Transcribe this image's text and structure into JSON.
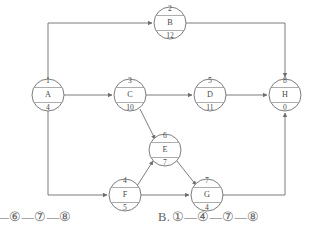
{
  "diagram": {
    "type": "activity-on-node network diagram",
    "nodes": [
      {
        "id": "n2",
        "number": "2",
        "activity": "B",
        "duration": "12",
        "cx": 170,
        "cy": 23,
        "r": 16
      },
      {
        "id": "n1",
        "number": "1",
        "activity": "A",
        "duration": "4",
        "cx": 48,
        "cy": 95,
        "r": 16
      },
      {
        "id": "n3",
        "number": "3",
        "activity": "C",
        "duration": "10",
        "cx": 130,
        "cy": 95,
        "r": 16
      },
      {
        "id": "n5",
        "number": "5",
        "activity": "D",
        "duration": "11",
        "cx": 210,
        "cy": 95,
        "r": 16
      },
      {
        "id": "n8",
        "number": "8",
        "activity": "H",
        "duration": "0",
        "cx": 285,
        "cy": 95,
        "r": 16
      },
      {
        "id": "n6",
        "number": "6",
        "activity": "E",
        "duration": "7",
        "cx": 165,
        "cy": 150,
        "r": 16
      },
      {
        "id": "n4",
        "number": "4",
        "activity": "F",
        "duration": "5",
        "cx": 125,
        "cy": 195,
        "r": 16
      },
      {
        "id": "n7",
        "number": "7",
        "activity": "G",
        "duration": "4",
        "cx": 207,
        "cy": 195,
        "r": 16
      }
    ],
    "edges": [
      {
        "from": "1",
        "to": "2",
        "path": "A up and right to B"
      },
      {
        "from": "2",
        "to": "8",
        "path": "B right and down to H"
      },
      {
        "from": "1",
        "to": "3",
        "path": "A right to C"
      },
      {
        "from": "3",
        "to": "5",
        "path": "C right to D"
      },
      {
        "from": "5",
        "to": "8",
        "path": "D right to H"
      },
      {
        "from": "3",
        "to": "6",
        "path": "C diagonal down-right to E"
      },
      {
        "from": "1",
        "to": "4",
        "path": "A down and right to F"
      },
      {
        "from": "4",
        "to": "6",
        "path": "F diagonal up-right to E"
      },
      {
        "from": "6",
        "to": "7",
        "path": "E diagonal down-right to G"
      },
      {
        "from": "4",
        "to": "7",
        "path": "F right to G"
      },
      {
        "from": "7",
        "to": "8",
        "path": "G right and up to H"
      }
    ],
    "colors": {
      "stroke": "#6e6e6e",
      "node_fill": "#ffffff",
      "text": "#4a4a4a",
      "background": "#ffffff"
    }
  },
  "answers": {
    "left_option": {
      "text": ")—⑥—⑦—⑧"
    },
    "right_option": {
      "label": "B.",
      "text": "①—④—⑦—⑧"
    }
  }
}
